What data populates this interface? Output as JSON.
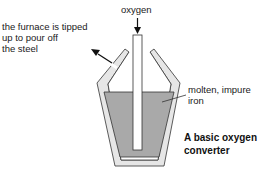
{
  "diagram": {
    "title_line1": "A basic oxygen",
    "title_line2": "converter",
    "labels": {
      "oxygen": "oxygen",
      "tipping_line1": "the furnace is tipped",
      "tipping_line2": "up to pour off",
      "tipping_line3": "the steel",
      "molten_line1": "molten, impure",
      "molten_line2": "iron"
    },
    "colors": {
      "vessel_wall": "#e6e6e6",
      "outline": "#333333",
      "molten_iron": "#a9a9a9",
      "background": "#ffffff"
    }
  }
}
